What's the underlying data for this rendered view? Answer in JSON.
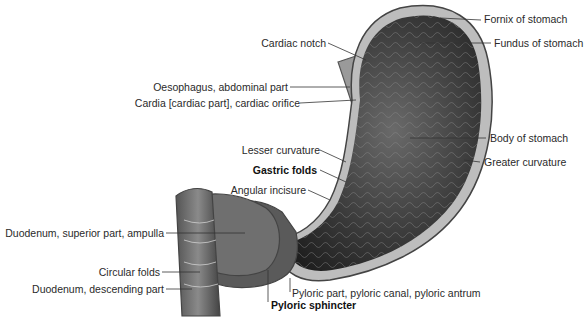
{
  "diagram": {
    "labels": [
      {
        "id": "fornix",
        "text": "Fornix of stomach",
        "bold": false
      },
      {
        "id": "fundus",
        "text": "Fundus of stomach",
        "bold": false
      },
      {
        "id": "cardiac_notch",
        "text": "Cardiac notch",
        "bold": false
      },
      {
        "id": "oesophagus",
        "text": "Oesophagus, abdominal part",
        "bold": false
      },
      {
        "id": "cardia",
        "text": "Cardia [cardiac part], cardiac orifice",
        "bold": false
      },
      {
        "id": "body",
        "text": "Body of stomach",
        "bold": false
      },
      {
        "id": "greater_curvature",
        "text": "Greater curvature",
        "bold": false
      },
      {
        "id": "lesser_curvature",
        "text": "Lesser curvature",
        "bold": false
      },
      {
        "id": "gastric_folds",
        "text": "Gastric folds",
        "bold": true
      },
      {
        "id": "angular_incisure",
        "text": "Angular incisure",
        "bold": false
      },
      {
        "id": "duodenum_superior",
        "text": "Duodenum, superior part, ampulla",
        "bold": false
      },
      {
        "id": "circular_folds",
        "text": "Circular folds",
        "bold": false
      },
      {
        "id": "duodenum_descending",
        "text": "Duodenum, descending part",
        "bold": false
      },
      {
        "id": "pyloric_part",
        "text": "Pyloric part, pyloric canal, pyloric antrum",
        "bold": false
      },
      {
        "id": "pyloric_sphincter",
        "text": "Pyloric sphincter",
        "bold": true
      }
    ]
  }
}
